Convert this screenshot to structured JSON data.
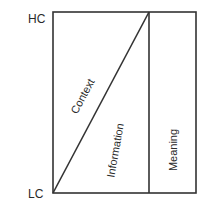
{
  "diagram": {
    "type": "context-information-meaning",
    "axis": {
      "top_label": "HC",
      "bottom_label": "LC"
    },
    "regions": {
      "context": "Context",
      "information": "Information",
      "meaning": "Meaning"
    },
    "colors": {
      "line": "#333333",
      "text": "#2a2a2a",
      "background": "#ffffff"
    }
  }
}
